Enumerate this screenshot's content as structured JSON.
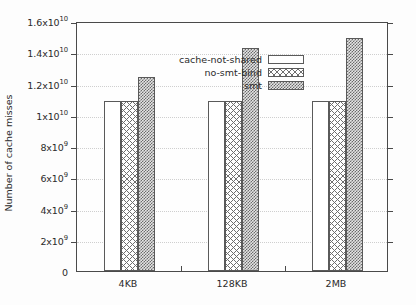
{
  "chart_data": {
    "type": "bar",
    "title": "",
    "xlabel": "",
    "ylabel": "Number of cache misses",
    "categories": [
      "4KB",
      "128KB",
      "2MB"
    ],
    "series": [
      {
        "name": "cache-not-shared",
        "pattern": "solid-white",
        "values": [
          10900000000,
          10900000000,
          10900000000
        ]
      },
      {
        "name": "no-smt-bind",
        "pattern": "x-crosshatch",
        "values": [
          10900000000,
          10900000000,
          10900000000
        ]
      },
      {
        "name": "smt",
        "pattern": "checkerboard",
        "values": [
          12400000000,
          14300000000,
          14900000000
        ]
      }
    ],
    "ylim": [
      0,
      16000000000
    ],
    "ytick_values": [
      0,
      2000000000,
      4000000000,
      6000000000,
      8000000000,
      10000000000,
      12000000000,
      14000000000,
      16000000000
    ],
    "ytick_labels": [
      {
        "mantissa": "0",
        "exp": ""
      },
      {
        "mantissa": "2x10",
        "exp": "9"
      },
      {
        "mantissa": "4x10",
        "exp": "9"
      },
      {
        "mantissa": "6x10",
        "exp": "9"
      },
      {
        "mantissa": "8x10",
        "exp": "9"
      },
      {
        "mantissa": "1x10",
        "exp": "10"
      },
      {
        "mantissa": "1.2x10",
        "exp": "10"
      },
      {
        "mantissa": "1.4x10",
        "exp": "10"
      },
      {
        "mantissa": "1.6x10",
        "exp": "10"
      }
    ],
    "grid": true,
    "grid_axis": "y",
    "legend_position": "top-left-inside",
    "colors": {
      "axis": "#4a4a4a",
      "grid": "#cfcfcf",
      "bar_outline": "#5a5a5a",
      "text": "#2b2b2b",
      "background": "#fdfdfd"
    }
  },
  "axis": {
    "y_title": "Number of cache misses"
  },
  "legend": {
    "items": [
      {
        "label": "cache-not-shared"
      },
      {
        "label": "no-smt-bind"
      },
      {
        "label": "smt"
      }
    ]
  }
}
